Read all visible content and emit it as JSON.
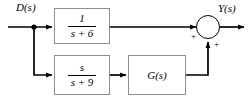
{
  "diagram": {
    "type": "control-block-diagram",
    "background_color": "#ffffff",
    "line_color": "#000000",
    "block_border_color": "#8c8c8c",
    "input": {
      "label": "D(s)"
    },
    "output": {
      "label": "Y(s)"
    },
    "blocks": [
      {
        "id": "block-top",
        "kind": "transfer-function",
        "numerator": "1",
        "denominator": "s + 6",
        "expression": "1/(s + 6)"
      },
      {
        "id": "block-bottom",
        "kind": "transfer-function",
        "numerator": "s",
        "denominator": "s + 9",
        "expression": "s/(s + 9)"
      },
      {
        "id": "block-gain",
        "kind": "transfer-function",
        "label": "G(s)",
        "expression": "G(s)"
      }
    ],
    "summing_junction": {
      "id": "summing-junction",
      "shape": "circle",
      "signs": [
        {
          "id": "sign-left",
          "symbol": "+"
        },
        {
          "id": "sign-bottom",
          "symbol": "+"
        }
      ]
    }
  }
}
